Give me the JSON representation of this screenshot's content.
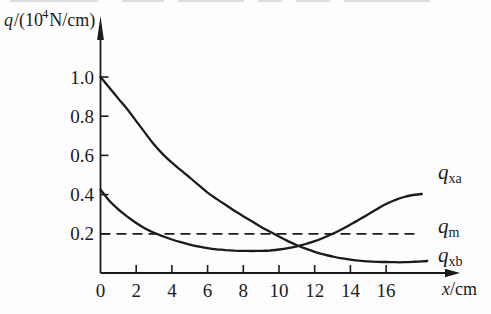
{
  "figure": {
    "bg": "#fdfdfd",
    "ink": "#1b1b1b"
  },
  "labels": {
    "y_axis": {
      "sym": "q",
      "pre": "/(10",
      "exp": "4",
      "post": "N/cm)"
    },
    "x_axis": {
      "sym": "x",
      "post": "/cm"
    },
    "curve_qxa": {
      "sym": "q",
      "sub": "xa"
    },
    "curve_qm": {
      "sym": "q",
      "sub": "m"
    },
    "curve_qxb": {
      "sym": "q",
      "sub": "xb"
    }
  },
  "chart_data": {
    "type": "line",
    "title": "",
    "xlabel": "x/cm",
    "ylabel": "q/(10^4 N/cm)",
    "xlim": [
      0,
      20.3
    ],
    "ylim": [
      0,
      1.28
    ],
    "x_ticks": [
      0,
      2,
      4,
      6,
      8,
      10,
      12,
      14,
      16
    ],
    "y_ticks": [
      0.2,
      0.4,
      0.6,
      0.8,
      1.0
    ],
    "grid": false,
    "legend_position": "right-of-curve-ends",
    "reference_line": {
      "name": "q_m",
      "value": 0.2,
      "style": "dashed",
      "x_start": 0,
      "x_end": 17.8
    },
    "series": [
      {
        "name": "q_xb",
        "points": [
          [
            0,
            1.0
          ],
          [
            0.5,
            0.945
          ],
          [
            1,
            0.89
          ],
          [
            1.5,
            0.835
          ],
          [
            2,
            0.775
          ],
          [
            2.5,
            0.715
          ],
          [
            3,
            0.655
          ],
          [
            3.5,
            0.605
          ],
          [
            4,
            0.563
          ],
          [
            4.5,
            0.525
          ],
          [
            5,
            0.487
          ],
          [
            5.5,
            0.448
          ],
          [
            6,
            0.41
          ],
          [
            6.5,
            0.378
          ],
          [
            7,
            0.348
          ],
          [
            7.5,
            0.318
          ],
          [
            8,
            0.29
          ],
          [
            8.5,
            0.262
          ],
          [
            9,
            0.235
          ],
          [
            9.5,
            0.21
          ],
          [
            10,
            0.186
          ],
          [
            10.5,
            0.163
          ],
          [
            11,
            0.142
          ],
          [
            11.5,
            0.124
          ],
          [
            12,
            0.108
          ],
          [
            12.5,
            0.095
          ],
          [
            13,
            0.084
          ],
          [
            13.5,
            0.075
          ],
          [
            14,
            0.068
          ],
          [
            14.5,
            0.063
          ],
          [
            15,
            0.059
          ],
          [
            15.5,
            0.057
          ],
          [
            16,
            0.056
          ],
          [
            16.5,
            0.055
          ],
          [
            17,
            0.055
          ],
          [
            17.5,
            0.057
          ],
          [
            18,
            0.059
          ],
          [
            18.3,
            0.061
          ]
        ]
      },
      {
        "name": "q_xa",
        "points": [
          [
            0,
            0.425
          ],
          [
            0.3,
            0.39
          ],
          [
            0.6,
            0.358
          ],
          [
            1,
            0.325
          ],
          [
            1.5,
            0.288
          ],
          [
            2,
            0.255
          ],
          [
            2.5,
            0.227
          ],
          [
            3,
            0.205
          ],
          [
            3.5,
            0.187
          ],
          [
            4,
            0.171
          ],
          [
            4.5,
            0.157
          ],
          [
            5,
            0.145
          ],
          [
            5.5,
            0.135
          ],
          [
            6,
            0.127
          ],
          [
            6.5,
            0.121
          ],
          [
            7,
            0.117
          ],
          [
            7.5,
            0.114
          ],
          [
            8,
            0.113
          ],
          [
            8.5,
            0.112
          ],
          [
            9,
            0.113
          ],
          [
            9.5,
            0.115
          ],
          [
            10,
            0.12
          ],
          [
            10.5,
            0.127
          ],
          [
            11,
            0.136
          ],
          [
            11.5,
            0.148
          ],
          [
            12,
            0.162
          ],
          [
            12.5,
            0.18
          ],
          [
            13,
            0.2
          ],
          [
            13.5,
            0.222
          ],
          [
            14,
            0.247
          ],
          [
            14.5,
            0.273
          ],
          [
            15,
            0.3
          ],
          [
            15.5,
            0.327
          ],
          [
            16,
            0.352
          ],
          [
            16.5,
            0.372
          ],
          [
            17,
            0.388
          ],
          [
            17.5,
            0.398
          ],
          [
            18,
            0.403
          ]
        ]
      }
    ]
  }
}
